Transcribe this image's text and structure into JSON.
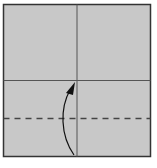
{
  "diagram": {
    "type": "origami-fold-step",
    "paper": {
      "fill": "#c8c8c8",
      "stroke": "#333333"
    },
    "crease_color": "#555555",
    "valley_fold_color": "#444444",
    "arrow_color": "#111111",
    "instruction": "valley fold bottom edge up to center line"
  }
}
